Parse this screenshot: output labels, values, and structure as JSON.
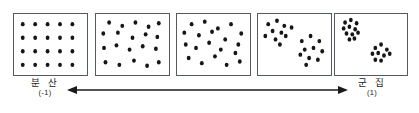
{
  "figure": {
    "type": "clustering-continuum-diagram",
    "panel_count": 5
  },
  "axis": {
    "left_label": {
      "term": "분 산",
      "value": "(-1)"
    },
    "right_label": {
      "term": "군 집",
      "value": "(1)"
    },
    "arrow": {
      "style": "double-headed",
      "direction": "horizontal",
      "color": "#1a1a1a"
    }
  },
  "panels": [
    {
      "name": "panel-dispersed-regular",
      "index": 1,
      "pattern": "regular-grid",
      "dot_count": 20,
      "dots": [
        [
          12,
          12
        ],
        [
          29,
          12
        ],
        [
          46,
          12
        ],
        [
          63,
          12
        ],
        [
          80,
          12
        ],
        [
          12,
          28
        ],
        [
          29,
          28
        ],
        [
          46,
          28
        ],
        [
          63,
          28
        ],
        [
          80,
          28
        ],
        [
          12,
          44
        ],
        [
          29,
          44
        ],
        [
          46,
          44
        ],
        [
          63,
          44
        ],
        [
          80,
          44
        ],
        [
          12,
          60
        ],
        [
          29,
          60
        ],
        [
          46,
          60
        ],
        [
          63,
          60
        ],
        [
          80,
          60
        ]
      ]
    },
    {
      "name": "panel-jittered-grid",
      "index": 2,
      "pattern": "jittered-grid",
      "dot_count": 20,
      "dots": [
        [
          18,
          10
        ],
        [
          36,
          14
        ],
        [
          54,
          10
        ],
        [
          72,
          15
        ],
        [
          86,
          11
        ],
        [
          10,
          23
        ],
        [
          30,
          22
        ],
        [
          50,
          28
        ],
        [
          68,
          24
        ],
        [
          84,
          27
        ],
        [
          11,
          40
        ],
        [
          28,
          37
        ],
        [
          46,
          42
        ],
        [
          64,
          38
        ],
        [
          82,
          41
        ],
        [
          13,
          57
        ],
        [
          32,
          60
        ],
        [
          52,
          55
        ],
        [
          70,
          61
        ],
        [
          86,
          57
        ]
      ]
    },
    {
      "name": "panel-random",
      "index": 3,
      "pattern": "random",
      "dot_count": 20,
      "dots": [
        [
          20,
          12
        ],
        [
          38,
          9
        ],
        [
          56,
          17
        ],
        [
          74,
          12
        ],
        [
          88,
          23
        ],
        [
          10,
          22
        ],
        [
          30,
          25
        ],
        [
          48,
          21
        ],
        [
          66,
          30
        ],
        [
          84,
          36
        ],
        [
          12,
          36
        ],
        [
          26,
          40
        ],
        [
          44,
          34
        ],
        [
          60,
          42
        ],
        [
          80,
          46
        ],
        [
          16,
          52
        ],
        [
          34,
          58
        ],
        [
          52,
          50
        ],
        [
          68,
          60
        ],
        [
          86,
          56
        ]
      ]
    },
    {
      "name": "panel-two-loose-clusters",
      "index": 4,
      "pattern": "two-loose-clusters",
      "dot_count": 20,
      "dots": [
        [
          14,
          12
        ],
        [
          26,
          8
        ],
        [
          36,
          14
        ],
        [
          20,
          20
        ],
        [
          32,
          22
        ],
        [
          10,
          26
        ],
        [
          24,
          30
        ],
        [
          38,
          26
        ],
        [
          46,
          16
        ],
        [
          30,
          36
        ],
        [
          60,
          32
        ],
        [
          72,
          26
        ],
        [
          84,
          32
        ],
        [
          64,
          42
        ],
        [
          76,
          40
        ],
        [
          88,
          44
        ],
        [
          58,
          48
        ],
        [
          70,
          52
        ],
        [
          82,
          54
        ],
        [
          66,
          60
        ]
      ]
    },
    {
      "name": "panel-two-tight-clusters",
      "index": 5,
      "pattern": "two-tight-clusters",
      "dot_count": 20,
      "dots": [
        [
          14,
          10
        ],
        [
          22,
          7
        ],
        [
          30,
          11
        ],
        [
          12,
          17
        ],
        [
          20,
          15
        ],
        [
          28,
          18
        ],
        [
          16,
          23
        ],
        [
          24,
          24
        ],
        [
          32,
          22
        ],
        [
          20,
          30
        ],
        [
          27,
          29
        ],
        [
          56,
          40
        ],
        [
          64,
          36
        ],
        [
          72,
          42
        ],
        [
          52,
          47
        ],
        [
          60,
          46
        ],
        [
          68,
          49
        ],
        [
          76,
          47
        ],
        [
          56,
          54
        ],
        [
          64,
          55
        ]
      ]
    }
  ],
  "panel_geometry": {
    "lefts": [
      13,
      95,
      176,
      257,
      334
    ],
    "widths": [
      75,
      75,
      75,
      75,
      74
    ],
    "top": 13,
    "height": 63,
    "viewbox_width": 100,
    "viewbox_height": 72,
    "dot_radius": 2.6
  }
}
